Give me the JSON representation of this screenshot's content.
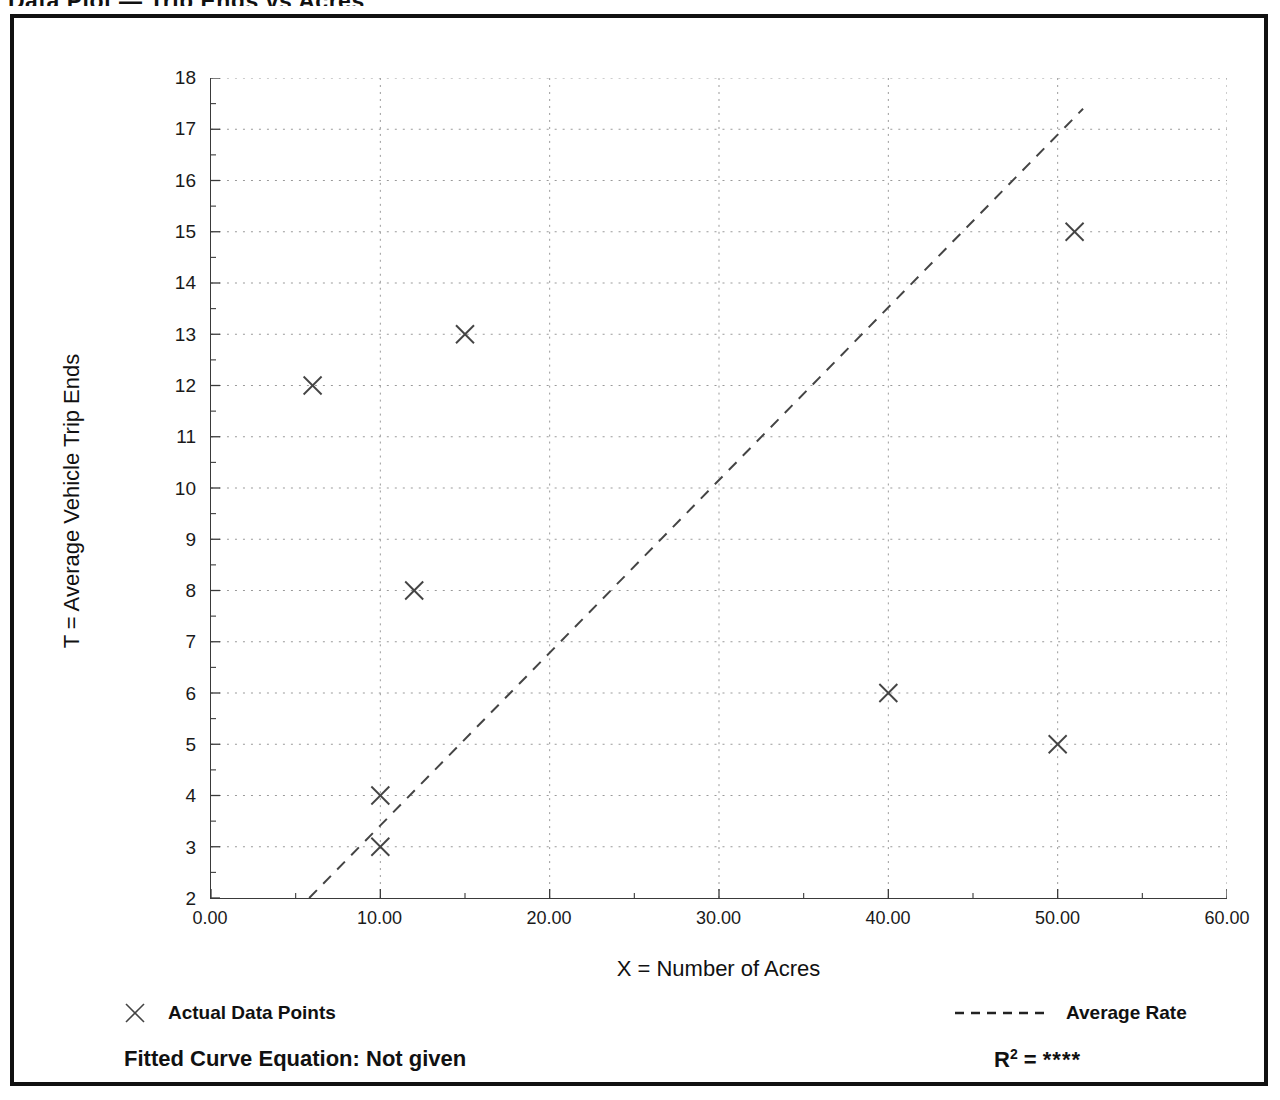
{
  "page_title": "Data Plot — Trip Ends vs Acres",
  "chart_data": {
    "type": "scatter",
    "title": "",
    "xlabel": "X = Number of Acres",
    "ylabel": "T = Average Vehicle Trip Ends",
    "xlim": [
      0,
      60
    ],
    "ylim": [
      2,
      18
    ],
    "x_ticks": [
      "0.00",
      "10.00",
      "20.00",
      "30.00",
      "40.00",
      "50.00",
      "60.00"
    ],
    "x_tick_values": [
      0,
      10,
      20,
      30,
      40,
      50,
      60
    ],
    "y_ticks": [
      "2",
      "3",
      "4",
      "5",
      "6",
      "7",
      "8",
      "9",
      "10",
      "11",
      "12",
      "13",
      "14",
      "15",
      "16",
      "17",
      "18"
    ],
    "y_tick_values": [
      2,
      3,
      4,
      5,
      6,
      7,
      8,
      9,
      10,
      11,
      12,
      13,
      14,
      15,
      16,
      17,
      18
    ],
    "grid": true,
    "grid_style": "dotted",
    "minor_ticks": true,
    "legend_position": "below-axes",
    "series": [
      {
        "name": "Actual Data Points",
        "type": "scatter",
        "marker": "x",
        "color": "#444444",
        "points": [
          {
            "x": 6,
            "y": 12
          },
          {
            "x": 10,
            "y": 4
          },
          {
            "x": 10,
            "y": 3
          },
          {
            "x": 12,
            "y": 8
          },
          {
            "x": 15,
            "y": 13
          },
          {
            "x": 40,
            "y": 6
          },
          {
            "x": 50,
            "y": 5
          },
          {
            "x": 51,
            "y": 15
          }
        ]
      },
      {
        "name": "Average Rate",
        "type": "line",
        "linestyle": "dashed",
        "color": "#444444",
        "endpoints": [
          {
            "x": 5.8,
            "y": 2
          },
          {
            "x": 51.5,
            "y": 17.4
          }
        ]
      }
    ],
    "annotations": {
      "fitted_curve_equation": "Fitted Curve Equation:  Not given",
      "r_squared_symbol": "R",
      "r_squared_exponent": "2",
      "r_squared_equals": " = ",
      "r_squared_value": "****"
    }
  },
  "legend": {
    "data_points_label": "Actual Data Points",
    "average_rate_label": "Average Rate"
  },
  "colors": {
    "frame": "#111111",
    "axis": "#3a3a3a",
    "grid": "#9a9a9a",
    "marker": "#444444",
    "line": "#444444",
    "text": "#111111"
  }
}
